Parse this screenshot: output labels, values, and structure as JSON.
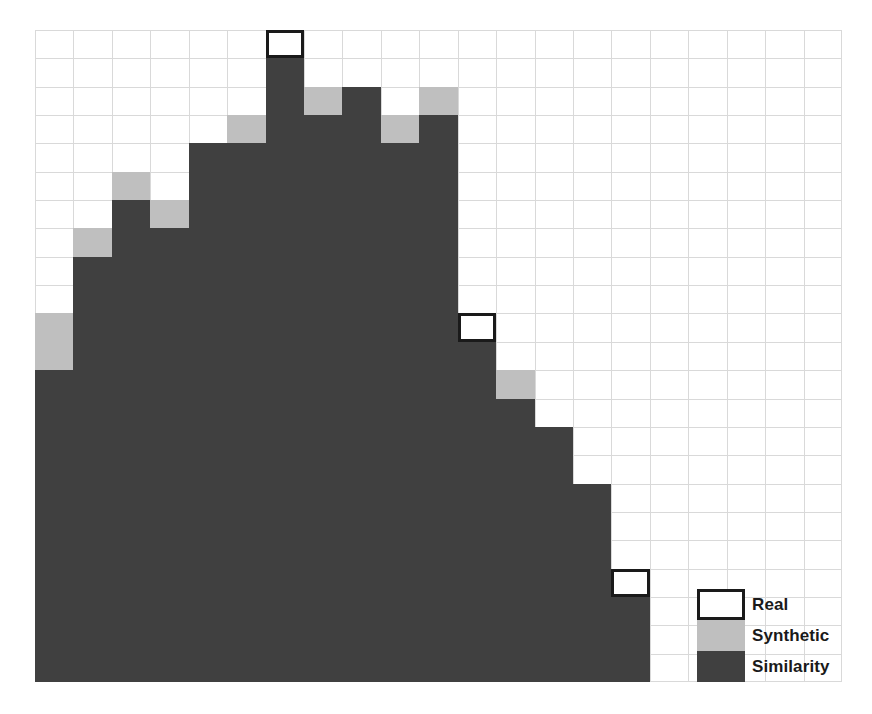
{
  "chart_data": {
    "type": "bar",
    "title": "",
    "subtitle": "",
    "xlabel": "",
    "ylabel": "",
    "grid": true,
    "stacked": false,
    "overlaid": true,
    "legend_position": "bottom-right",
    "ylim": [
      0,
      23
    ],
    "y_unit": "grid rows",
    "categories": [
      "1",
      "2",
      "3",
      "4",
      "5",
      "6",
      "7",
      "8",
      "9",
      "10",
      "11",
      "12",
      "13",
      "14",
      "15",
      "16"
    ],
    "series": [
      {
        "name": "Real",
        "color": "#ffffff",
        "edge_color": "#1a1a1a",
        "style": "outline",
        "values": [
          13,
          16,
          18,
          17,
          19,
          20,
          23,
          21,
          21,
          20,
          21,
          13,
          11,
          9,
          7,
          4
        ]
      },
      {
        "name": "Synthetic",
        "color": "#bfbfbf",
        "style": "filled",
        "values": [
          13,
          16,
          18,
          17,
          19,
          20,
          22,
          21,
          21,
          20,
          21,
          12,
          11,
          9,
          7,
          3
        ]
      },
      {
        "name": "Similarity",
        "color": "#404040",
        "style": "filled",
        "values": [
          11,
          15,
          17,
          16,
          19,
          19,
          22,
          20,
          21,
          19,
          20,
          12,
          10,
          9,
          7,
          3
        ]
      }
    ]
  },
  "plot": {
    "columns": 21,
    "rows": 23,
    "gridline_color": "#d9d9d9",
    "background": "#ffffff"
  },
  "legend": {
    "items": [
      {
        "label": "Real",
        "swatch": "real"
      },
      {
        "label": "Synthetic",
        "swatch": "synthetic"
      },
      {
        "label": "Similarity",
        "swatch": "similarity"
      }
    ]
  }
}
